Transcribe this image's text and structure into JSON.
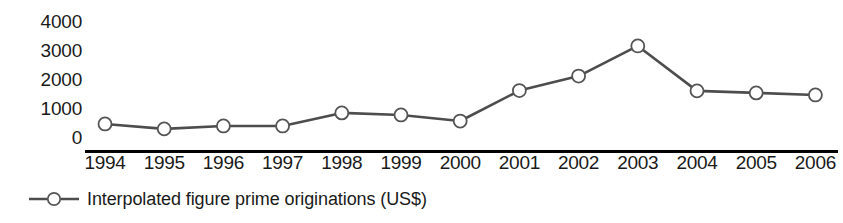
{
  "chart_data": {
    "type": "line",
    "title": "",
    "subtitle": "",
    "xlabel": "",
    "ylabel": "",
    "categories": [
      "1994",
      "1995",
      "1996",
      "1997",
      "1998",
      "1999",
      "2000",
      "2001",
      "2002",
      "2003",
      "2004",
      "2005",
      "2006"
    ],
    "series": [
      {
        "name": "Interpolated figure prime originations (US$)",
        "values": [
          830,
          660,
          760,
          760,
          1210,
          1140,
          930,
          1980,
          2480,
          3520,
          1970,
          1900,
          1830
        ]
      }
    ],
    "ylim": [
      0,
      4400
    ],
    "yticks": [
      0,
      1000,
      2000,
      3000,
      4000
    ],
    "ytick_labels": [
      "0",
      "1000",
      "2000",
      "3000",
      "4000"
    ],
    "xtick_labels": [
      "1994",
      "1995",
      "1996",
      "1997",
      "1998",
      "1999",
      "2000",
      "2001",
      "2002",
      "2003",
      "2004",
      "2005",
      "2006"
    ],
    "grid": false,
    "legend_position": "below-left",
    "legend_entries": [
      "Interpolated figure prime originations (US$)"
    ],
    "annotations": [],
    "style": {
      "line_color": "#4d4d4d",
      "marker_face_color": "#ffffff",
      "marker_edge_color": "#555555",
      "axis_color": "#000000",
      "text_color": "#1a1a1a",
      "marker": "circle",
      "marker_size": 13
    }
  },
  "axes": {
    "y_tick_labels": [
      "4000",
      "3000",
      "2000",
      "1000",
      "0"
    ],
    "x_tick_labels": [
      "1994",
      "1995",
      "1996",
      "1997",
      "1998",
      "1999",
      "2000",
      "2001",
      "2002",
      "2003",
      "2004",
      "2005",
      "2006"
    ]
  },
  "legend": {
    "label": "Interpolated figure prime originations (US$)"
  }
}
